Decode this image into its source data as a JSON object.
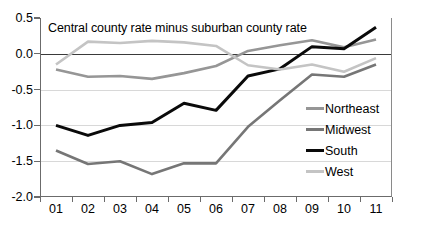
{
  "chart_data": {
    "type": "line",
    "title": "Central county rate minus suburban county rate",
    "xlabel": "",
    "ylabel": "",
    "x": [
      "01",
      "02",
      "03",
      "04",
      "05",
      "06",
      "07",
      "08",
      "09",
      "10",
      "11"
    ],
    "categories": [
      "01",
      "02",
      "03",
      "04",
      "05",
      "06",
      "07",
      "08",
      "09",
      "10",
      "11"
    ],
    "ylim": [
      -2.0,
      0.5
    ],
    "yticks": [
      0.5,
      0.0,
      -0.5,
      -1.0,
      -1.5,
      -2.0
    ],
    "ytick_labels": [
      "0.5",
      "0.0",
      "-0.5",
      "-1.0",
      "-1.5",
      "-2.0"
    ],
    "grid": "horizontal",
    "legend_position": "right-inside",
    "series": [
      {
        "name": "Northeast",
        "color": "#969696",
        "width": 2.6,
        "values": [
          -0.22,
          -0.32,
          -0.31,
          -0.35,
          -0.27,
          -0.17,
          0.04,
          0.12,
          0.19,
          0.09,
          0.2
        ]
      },
      {
        "name": "Midwest",
        "color": "#767676",
        "width": 2.6,
        "values": [
          -1.35,
          -1.54,
          -1.5,
          -1.68,
          -1.53,
          -1.53,
          -1.02,
          -0.65,
          -0.29,
          -0.32,
          -0.15
        ]
      },
      {
        "name": "South",
        "color": "#0a0a0a",
        "width": 3.0,
        "values": [
          -1.0,
          -1.14,
          -1.0,
          -0.96,
          -0.69,
          -0.79,
          -0.31,
          -0.21,
          0.1,
          0.07,
          0.37
        ]
      },
      {
        "name": "West",
        "color": "#c4c4c4",
        "width": 2.6,
        "values": [
          -0.15,
          0.17,
          0.15,
          0.18,
          0.16,
          0.11,
          -0.16,
          -0.22,
          -0.15,
          -0.25,
          -0.06
        ]
      }
    ]
  },
  "legend": {
    "items": [
      {
        "label": "Northeast"
      },
      {
        "label": "Midwest"
      },
      {
        "label": "South"
      },
      {
        "label": "West"
      }
    ]
  },
  "colors": {
    "northeast": "#969696",
    "midwest": "#767676",
    "south": "#0a0a0a",
    "west": "#c4c4c4",
    "axis": "#6b6b6b",
    "gridline": "#d8d8d8",
    "zeroline": "#3a3a3a",
    "background": "#ffffff"
  }
}
